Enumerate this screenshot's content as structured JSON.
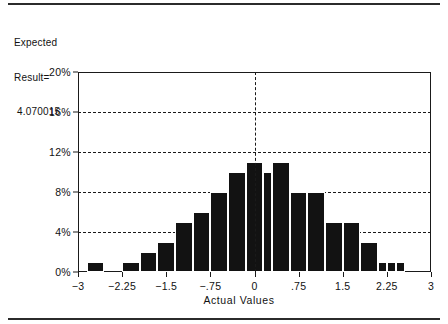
{
  "annotation": {
    "line1": "Expected",
    "line2": "Result=",
    "line3": " 4.070015"
  },
  "chart_data": {
    "type": "bar",
    "title": "",
    "subtitle": "",
    "xlabel": "Actual Values",
    "ylabel": "",
    "xlim": [
      -3,
      3
    ],
    "ylim": [
      0,
      20
    ],
    "grid": true,
    "legend": null,
    "y_ticks": [
      0,
      4,
      8,
      12,
      16,
      20
    ],
    "y_tick_labels": [
      "0%",
      "4%",
      "8%",
      "12%",
      "16%",
      "20%"
    ],
    "x_ticks": [
      -3,
      -2.25,
      -1.5,
      -0.75,
      0,
      0.75,
      1.5,
      2.25,
      3
    ],
    "x_tick_labels": [
      "−3",
      "−2.25",
      "−1.5",
      "−.75",
      "0",
      ".75",
      "1.5",
      "2.25",
      "3"
    ],
    "annotations": [
      {
        "name": "zero-reference-line",
        "type": "vline",
        "x": 0,
        "style": "dashed"
      }
    ],
    "bin_width": 0.3,
    "bars": [
      {
        "x0": -2.85,
        "x1": -2.55,
        "value": 1
      },
      {
        "x0": -2.25,
        "x1": -1.95,
        "value": 1
      },
      {
        "x0": -1.95,
        "x1": -1.65,
        "value": 2
      },
      {
        "x0": -1.65,
        "x1": -1.35,
        "value": 3
      },
      {
        "x0": -1.35,
        "x1": -1.05,
        "value": 5
      },
      {
        "x0": -1.05,
        "x1": -0.75,
        "value": 6
      },
      {
        "x0": -0.75,
        "x1": -0.45,
        "value": 8
      },
      {
        "x0": -0.45,
        "x1": -0.15,
        "value": 10
      },
      {
        "x0": -0.15,
        "x1": 0.15,
        "value": 11
      },
      {
        "x0": 0.15,
        "x1": 0.3,
        "value": 10
      },
      {
        "x0": 0.3,
        "x1": 0.6,
        "value": 11
      },
      {
        "x0": 0.6,
        "x1": 0.9,
        "value": 8
      },
      {
        "x0": 0.9,
        "x1": 1.2,
        "value": 8
      },
      {
        "x0": 1.2,
        "x1": 1.5,
        "value": 5
      },
      {
        "x0": 1.5,
        "x1": 1.8,
        "value": 5
      },
      {
        "x0": 1.8,
        "x1": 2.1,
        "value": 3
      },
      {
        "x0": 2.1,
        "x1": 2.25,
        "value": 1
      },
      {
        "x0": 2.25,
        "x1": 2.4,
        "value": 1
      },
      {
        "x0": 2.4,
        "x1": 2.55,
        "value": 1
      }
    ],
    "colors": {
      "bar": "#121212",
      "axis": "#1a1a1a",
      "grid": "#1a1a1a",
      "background": "#ffffff"
    }
  }
}
